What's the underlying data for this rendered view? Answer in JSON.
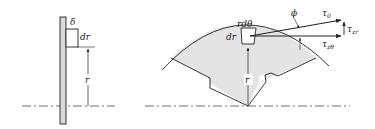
{
  "figure": {
    "left_view": {
      "labels": {
        "thickness": "δ",
        "element_height": "dr",
        "radius": "r"
      }
    },
    "right_view": {
      "labels": {
        "arc_length": "rdθ",
        "element_height": "dr",
        "radius": "r",
        "angle": "ϕ",
        "tau0": "τ",
        "tau0_sub": "0",
        "tau_zr": "τ",
        "tau_zr_sub": "zr",
        "tau_ztheta": "τ",
        "tau_ztheta_sub": "zθ"
      }
    },
    "colors": {
      "line": "#222222",
      "fill": "#e4e4e4"
    }
  }
}
